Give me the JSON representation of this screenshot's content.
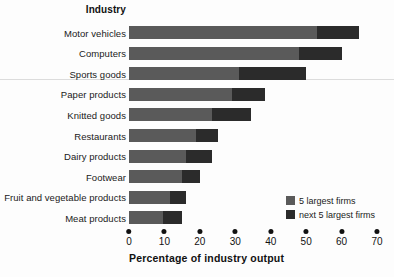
{
  "header": {
    "category_column_title": "Industry"
  },
  "legend": {
    "position": "bottom-right",
    "items": [
      {
        "label": "5 largest firms",
        "color": "#5a5a5a",
        "name": "legend-five-largest"
      },
      {
        "label": "next 5 largest firms",
        "color": "#2b2b2b",
        "name": "legend-next-five-largest"
      }
    ]
  },
  "axis": {
    "title": "Percentage of industry output",
    "ticks": [
      "0",
      "10",
      "20",
      "30",
      "40",
      "50",
      "60",
      "70"
    ]
  },
  "chart_data": {
    "type": "bar",
    "orientation": "horizontal",
    "stacked": true,
    "title": "",
    "subtitle": "",
    "xlabel": "Percentage of industry output",
    "ylabel": "Industry",
    "xlim": [
      0,
      70
    ],
    "xticks": [
      0,
      10,
      20,
      30,
      40,
      50,
      60,
      70
    ],
    "grid": false,
    "legend_position": "bottom-right",
    "categories": [
      "Motor vehicles",
      "Computers",
      "Sports goods",
      "Paper products",
      "Knitted goods",
      "Restaurants",
      "Dairy products",
      "Footwear",
      "Fruit and vegetable products",
      "Meat products"
    ],
    "series": [
      {
        "name": "5 largest firms",
        "color": "#5a5a5a",
        "values": [
          53,
          48,
          31,
          29,
          23.5,
          19,
          16,
          15,
          11.5,
          9.5
        ]
      },
      {
        "name": "next 5 largest firms",
        "color": "#2b2b2b",
        "values": [
          12,
          12,
          19,
          9.5,
          11,
          6,
          7.5,
          5,
          4.5,
          5.5
        ]
      }
    ],
    "totals": [
      65,
      60,
      50,
      38.5,
      34.5,
      25,
      23.5,
      20,
      16,
      15
    ]
  }
}
